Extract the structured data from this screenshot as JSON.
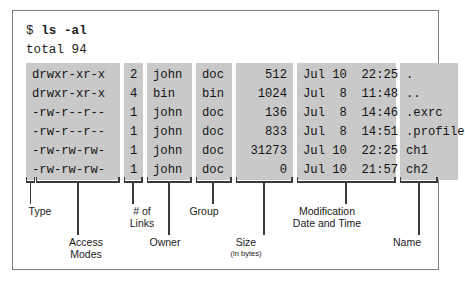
{
  "terminal": {
    "prompt_sigil": "$ ",
    "command": "ls -al",
    "total_line": "total 94"
  },
  "columns": {
    "permissions": [
      "drwxr-xr-x",
      "drwxr-xr-x",
      "-rw-r--r--",
      "-rw-r--r--",
      "-rw-rw-rw-",
      "-rw-rw-rw-"
    ],
    "links": [
      "2",
      "4",
      "1",
      "1",
      "1",
      "1"
    ],
    "owner": [
      "john",
      "bin",
      "john",
      "john",
      "john",
      "john"
    ],
    "group": [
      "doc",
      "bin",
      "doc",
      "doc",
      "doc",
      "doc"
    ],
    "size": [
      "512",
      "1024",
      "136",
      "833",
      "31273",
      "0"
    ],
    "date": [
      "Jul 10  22:25",
      "Jul  8  11:48",
      "Jul  8  14:46",
      "Jul  8  14:51",
      "Jul 10  22:25",
      "Jul 10  21:57"
    ],
    "name": [
      ".",
      "..",
      ".exrc",
      ".profile",
      "ch1",
      "ch2"
    ]
  },
  "labels": {
    "type": "Type",
    "access_modes": "Access\nModes",
    "links": "# of\nLinks",
    "owner": "Owner",
    "group": "Group",
    "size_main": "Size",
    "size_sub": "(in bytes)",
    "modification": "Modification\nDate and Time",
    "name": "Name"
  },
  "colors": {
    "highlight": "#c9c9c9",
    "frame_border": "#808080",
    "text": "#141414",
    "leader_line": "#3a3a3a"
  }
}
